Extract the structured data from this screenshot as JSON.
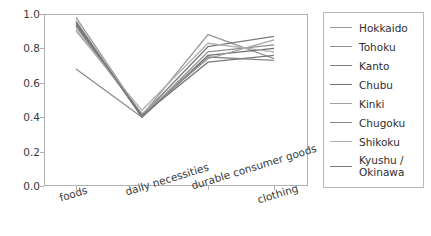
{
  "chart_data": {
    "type": "line",
    "title": "",
    "xlabel": "",
    "ylabel": "",
    "ylim": [
      0.0,
      1.0
    ],
    "yticks": [
      "0.0",
      "0.2",
      "0.4",
      "0.6",
      "0.8",
      "1.0"
    ],
    "ytick_values": [
      0.0,
      0.2,
      0.4,
      0.6,
      0.8,
      1.0
    ],
    "grid": false,
    "legend_position": "right-outside",
    "categories": [
      "foods",
      "daily necessities",
      "durable consumer goods",
      "clothing"
    ],
    "series": [
      {
        "name": "Hokkaido",
        "color": "#9a9a9a",
        "values": [
          0.98,
          0.41,
          0.88,
          0.74
        ]
      },
      {
        "name": "Tohoku",
        "color": "#8f8f8f",
        "values": [
          0.96,
          0.4,
          0.78,
          0.82
        ]
      },
      {
        "name": "Kanto",
        "color": "#7d7d7d",
        "values": [
          0.93,
          0.41,
          0.81,
          0.87
        ]
      },
      {
        "name": "Chubu",
        "color": "#6f6f6f",
        "values": [
          0.95,
          0.4,
          0.76,
          0.8
        ]
      },
      {
        "name": "Kinki",
        "color": "#a3a3a3",
        "values": [
          0.91,
          0.42,
          0.74,
          0.85
        ]
      },
      {
        "name": "Chugoku",
        "color": "#8a8a8a",
        "values": [
          0.68,
          0.4,
          0.75,
          0.73
        ]
      },
      {
        "name": "Shikoku",
        "color": "#b0b0b0",
        "values": [
          0.9,
          0.44,
          0.83,
          0.78
        ]
      },
      {
        "name": "Kyushu /\nOkinawa",
        "color": "#7a7a7a",
        "values": [
          0.94,
          0.41,
          0.72,
          0.76
        ]
      }
    ]
  },
  "legend": {
    "entries": [
      {
        "label": "Hokkaido"
      },
      {
        "label": "Tohoku"
      },
      {
        "label": "Kanto"
      },
      {
        "label": "Chubu"
      },
      {
        "label": "Kinki"
      },
      {
        "label": "Chugoku"
      },
      {
        "label": "Shikoku"
      },
      {
        "label": "Kyushu /\nOkinawa"
      }
    ]
  }
}
